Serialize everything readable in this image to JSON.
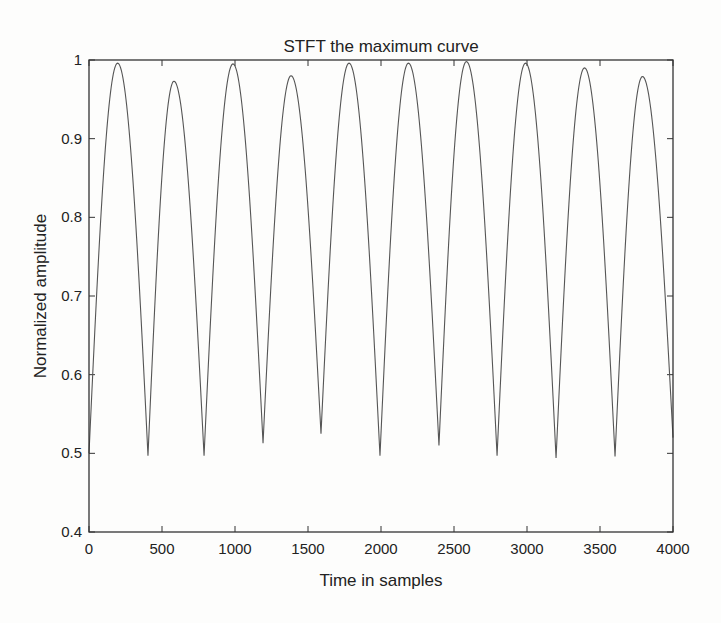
{
  "chart_data": {
    "type": "line",
    "title": "STFT the maximum curve",
    "xlabel": "Time in samples",
    "ylabel": "Normalized amplitude",
    "xlim": [
      0,
      4000
    ],
    "ylim": [
      0.4,
      1
    ],
    "xticks": [
      0,
      500,
      1000,
      1500,
      2000,
      2500,
      3000,
      3500,
      4000
    ],
    "xtick_labels": [
      "0",
      "500",
      "1000",
      "1500",
      "2000",
      "2500",
      "3000",
      "3500",
      "4000"
    ],
    "yticks": [
      0.4,
      0.5,
      0.6,
      0.7,
      0.8,
      0.9,
      1
    ],
    "ytick_labels": [
      "0.4",
      "0.5",
      "0.6",
      "0.7",
      "0.8",
      "0.9",
      "1"
    ],
    "grid": false,
    "legend": null,
    "line_color": "#555555",
    "axis_color": "#333333",
    "series": [
      {
        "name": "maximum curve",
        "x": [
          0,
          196,
          404,
          582,
          788,
          986,
          1192,
          1384,
          1589,
          1781,
          1993,
          2188,
          2397,
          2585,
          2795,
          2990,
          3199,
          3394,
          3603,
          3791,
          4000
        ],
        "y": [
          0.5,
          0.996,
          0.497,
          0.973,
          0.497,
          0.995,
          0.513,
          0.98,
          0.525,
          0.996,
          0.497,
          0.996,
          0.51,
          0.998,
          0.497,
          0.996,
          0.494,
          0.99,
          0.496,
          0.979,
          0.52
        ]
      }
    ]
  }
}
